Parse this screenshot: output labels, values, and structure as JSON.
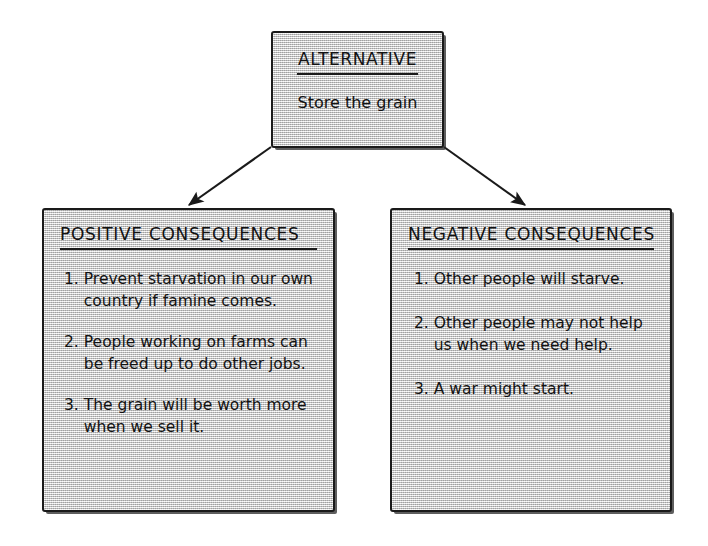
{
  "diagram": {
    "type": "decision-consequence-chart",
    "alternative": {
      "title": "ALTERNATIVE",
      "body": "Store the grain"
    },
    "positive": {
      "title": "POSITIVE CONSEQUENCES",
      "items": [
        {
          "number": "1.",
          "text": "Prevent starvation in our own country if famine comes."
        },
        {
          "number": "2.",
          "text": "People working on farms can be freed up to do other jobs."
        },
        {
          "number": "3.",
          "text": "The grain will be worth more when we sell it."
        }
      ]
    },
    "negative": {
      "title": "NEGATIVE CONSEQUENCES",
      "items": [
        {
          "number": "1.",
          "text": "Other people will starve."
        },
        {
          "number": "2.",
          "text": "Other people may not help us when we need help."
        },
        {
          "number": "3.",
          "text": "A war might start."
        }
      ]
    },
    "connectors": [
      {
        "name": "arrow-alternative-to-positive",
        "from": "alternative",
        "to": "positive"
      },
      {
        "name": "arrow-alternative-to-negative",
        "from": "alternative",
        "to": "negative"
      }
    ],
    "colors": {
      "box_fill": "#d0d0d0",
      "box_border": "#1a1a1a",
      "text": "#121212",
      "page_background": "#ffffff"
    }
  }
}
